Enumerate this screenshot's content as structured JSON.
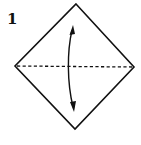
{
  "step": {
    "number": "1"
  },
  "diagram": {
    "shape": "square-diamond",
    "fold_line": "valley-fold-horizontal-dashed",
    "arrow": "curved-double-headed-arrow",
    "colors": {
      "line": "#111111",
      "background": "#ffffff"
    }
  }
}
